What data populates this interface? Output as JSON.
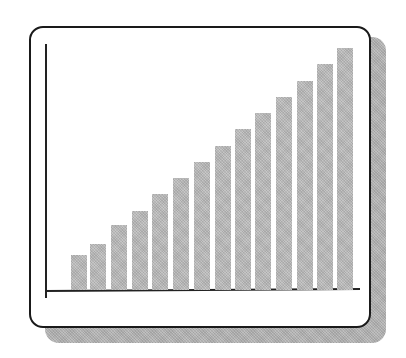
{
  "chart_data": {
    "type": "bar",
    "title": "",
    "xlabel": "",
    "ylabel": "",
    "categories": [
      "1",
      "2",
      "3",
      "4",
      "5",
      "6",
      "7",
      "8",
      "9",
      "10",
      "11",
      "12",
      "13",
      "14"
    ],
    "values": [
      35,
      46,
      65,
      79,
      96,
      112,
      128,
      144,
      161,
      177,
      193,
      209,
      226,
      242
    ],
    "value_units": "relative height (px, no axis scale shown)",
    "ylim": [
      0,
      250
    ],
    "grid": false,
    "legend": null,
    "tick_labels": "none",
    "style": {
      "bar_color": "#b9b9b9",
      "axis_color": "#222222",
      "frame": "rounded rectangle with drop shadow",
      "shadow_color": "#b4b4b4"
    }
  },
  "layout": {
    "bar_left": [
      71,
      90,
      111,
      132,
      152,
      173,
      194,
      215,
      235,
      255,
      276,
      297,
      317,
      337
    ],
    "bar_width": 16
  }
}
